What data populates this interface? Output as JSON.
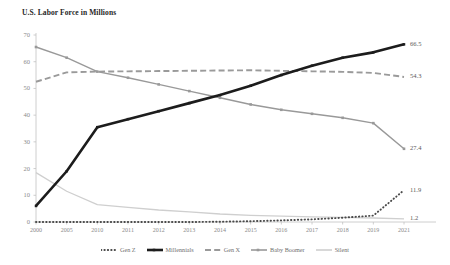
{
  "chart_data": {
    "type": "line",
    "title": "U.S. Labor Force in Millions",
    "xlabel": "",
    "ylabel": "",
    "ylim": [
      0,
      70
    ],
    "yticks": [
      0,
      10,
      20,
      30,
      40,
      50,
      60,
      70
    ],
    "grid": false,
    "legend_position": "bottom",
    "x": [
      "2000",
      "2005",
      "2010",
      "2011",
      "2012",
      "2013",
      "2014",
      "2015",
      "2016",
      "2017",
      "2018",
      "2019",
      "2021"
    ],
    "categories": [
      "2000",
      "2005",
      "2010",
      "2011",
      "2012",
      "2013",
      "2014",
      "2015",
      "2016",
      "2017",
      "2018",
      "2019",
      "2021"
    ],
    "series": [
      {
        "name": "Gen Z",
        "style": "dotted",
        "color": "#4a4a4a",
        "values": [
          0,
          0,
          0,
          0,
          0,
          0,
          0.1,
          0.3,
          0.6,
          1.0,
          1.6,
          2.4,
          11.9
        ],
        "end_label": "11.9"
      },
      {
        "name": "Millennials",
        "style": "solid-thick",
        "color": "#1c1c1c",
        "values": [
          6.0,
          19.0,
          35.5,
          38.5,
          41.5,
          44.5,
          47.5,
          51.0,
          55.0,
          58.5,
          61.5,
          63.5,
          66.5
        ],
        "end_label": "66.5"
      },
      {
        "name": "Gen X",
        "style": "dashed",
        "color": "#9a9a9a",
        "values": [
          52.5,
          56.0,
          56.3,
          56.4,
          56.5,
          56.6,
          56.7,
          56.8,
          56.6,
          56.4,
          56.2,
          55.8,
          54.3
        ],
        "end_label": "54.3"
      },
      {
        "name": "Baby Boomer",
        "style": "solid",
        "color": "#999999",
        "values": [
          65.5,
          61.5,
          56.3,
          54.0,
          51.5,
          49.0,
          46.5,
          44.0,
          42.0,
          40.5,
          39.0,
          37.0,
          27.4
        ],
        "end_label": "27.4"
      },
      {
        "name": "Silent",
        "style": "solid-light",
        "color": "#cfcfcf",
        "values": [
          18.5,
          11.5,
          6.5,
          5.5,
          4.5,
          3.8,
          3.0,
          2.5,
          2.2,
          1.9,
          1.7,
          1.5,
          1.2
        ],
        "end_label": "1.2"
      }
    ]
  },
  "legend": {
    "items": [
      {
        "label": "Gen Z"
      },
      {
        "label": "Millennials"
      },
      {
        "label": "Gen X"
      },
      {
        "label": "Baby Boomer"
      },
      {
        "label": "Silent"
      }
    ]
  }
}
